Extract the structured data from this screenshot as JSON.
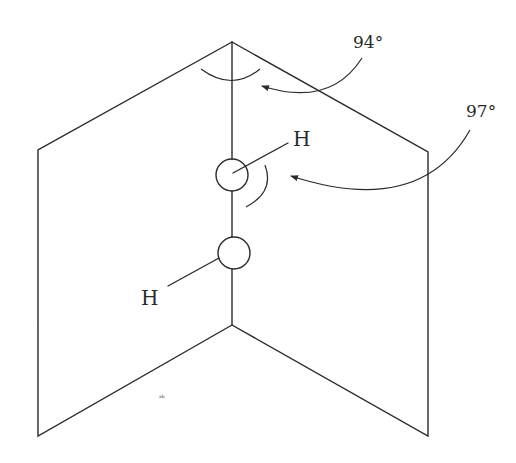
{
  "diagram": {
    "type": "molecular-geometry",
    "atoms": [
      {
        "label": "H",
        "position": "upper-right"
      },
      {
        "label": "H",
        "position": "lower-left"
      }
    ],
    "angles": [
      {
        "label": "94°",
        "refers_to": "dihedral angle between planes"
      },
      {
        "label": "97°",
        "refers_to": "O–O–H bond angle"
      }
    ],
    "stray_mark": "ᵃᵇ"
  }
}
